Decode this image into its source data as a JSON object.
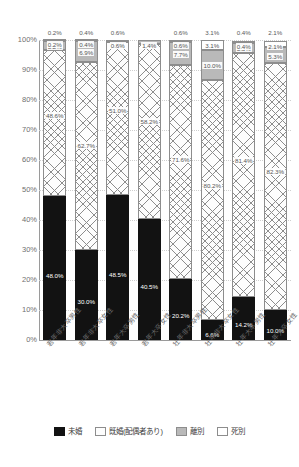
{
  "chart_data": {
    "type": "bar",
    "stacked": true,
    "stack_mode": "percent",
    "title": "",
    "xlabel": "",
    "ylabel": "",
    "ylim": [
      0,
      100
    ],
    "ytick_labels": [
      "100%",
      "90%",
      "80%",
      "70%",
      "60%",
      "50%",
      "40%",
      "30%",
      "20%",
      "10%",
      "0%"
    ],
    "ytick_values": [
      100,
      90,
      80,
      70,
      60,
      50,
      40,
      30,
      20,
      10,
      0
    ],
    "grid": true,
    "legend_position": "bottom",
    "categories": [
      "若年非大卒男性",
      "若年非大卒女性",
      "若年大卒男性",
      "若年大卒女性",
      "壮年非大卒男性",
      "壮年非大卒女性",
      "壮年大卒男性",
      "壮年大卒女性"
    ],
    "series": [
      {
        "name": "未婚",
        "color": "#121212",
        "pattern": "solid",
        "values": [
          48.0,
          30.0,
          48.5,
          40.5,
          20.2,
          6.6,
          14.2,
          10.0
        ],
        "labels": [
          "48.0%",
          "30.0%",
          "48.5%",
          "40.5%",
          "20.2%",
          "6.6%",
          "14.2%",
          "10.0%"
        ]
      },
      {
        "name": "既婚(配偶者あり)",
        "color": "#fdfdfd",
        "pattern": "crosshatch",
        "values": [
          48.6,
          62.7,
          51.0,
          58.2,
          71.6,
          80.2,
          81.4,
          82.3
        ],
        "labels": [
          "48.6%",
          "62.7%",
          "51.0%",
          "58.2%",
          "71.6%",
          "80.2%",
          "81.4%",
          "82.3%"
        ]
      },
      {
        "name": "離別",
        "color": "#b9b9b9",
        "pattern": "solid",
        "values": [
          3.2,
          6.9,
          0.0,
          1.4,
          7.7,
          10.0,
          3.5,
          5.3
        ],
        "labels": [
          "3.2%",
          "6.9%",
          "",
          "1.4%",
          "7.7%",
          "10.0%",
          "3.5%",
          "5.3%"
        ]
      },
      {
        "name": "死別",
        "color": "#ffffff",
        "pattern": "solid",
        "values": [
          0.2,
          0.4,
          0.6,
          0.0,
          0.6,
          3.1,
          0.4,
          2.1
        ],
        "labels": [
          "0.2%",
          "0.4%",
          "0.6%",
          "",
          "0.6%",
          "3.1%",
          "0.4%",
          "2.1%"
        ]
      }
    ],
    "top_labels": [
      "0.2%",
      "0.4%",
      "0.6%",
      "",
      "0.6%",
      "3.1%",
      "0.4%",
      "2.1%"
    ]
  }
}
